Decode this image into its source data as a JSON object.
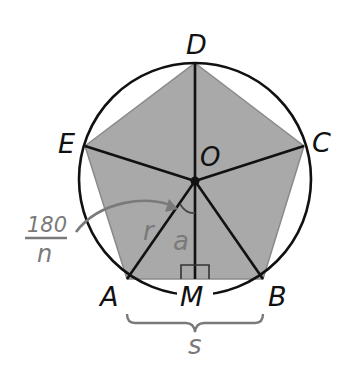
{
  "diagram": {
    "colors": {
      "background": "#ffffff",
      "fill": "#a9a9a9",
      "stroke": "#111111",
      "annotation": "#7a7a7a"
    },
    "vertices": {
      "A": "A",
      "B": "B",
      "C": "C",
      "D": "D",
      "E": "E"
    },
    "center_label": "O",
    "midpoint_label": "M",
    "radius_label": "r",
    "apothem_label": "a",
    "side_label": "s",
    "angle_annotation": {
      "numerator": "180",
      "denominator": "n"
    }
  }
}
